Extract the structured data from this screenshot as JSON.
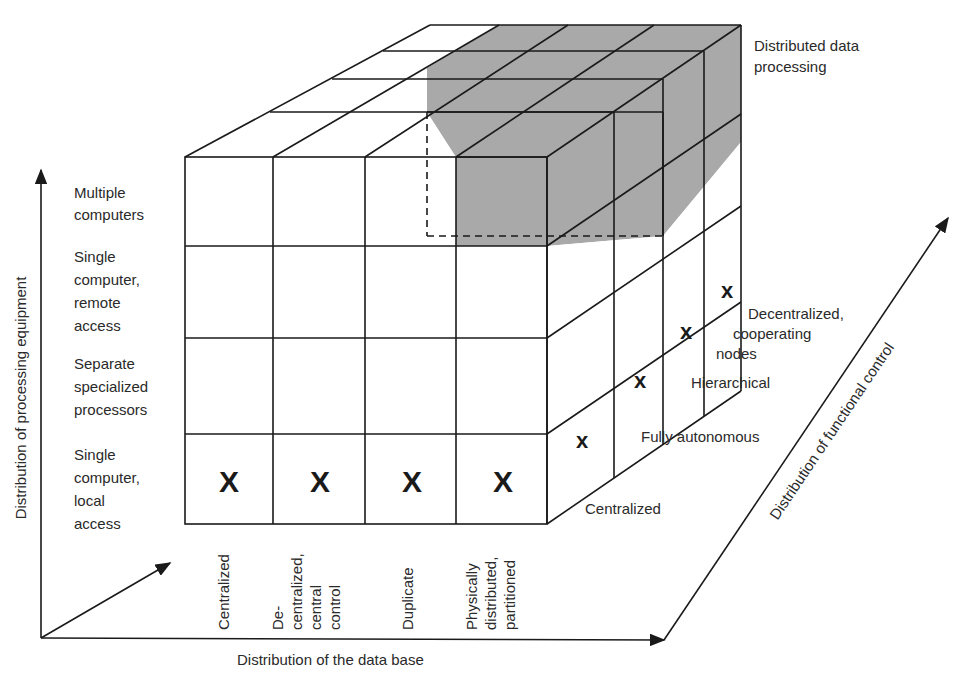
{
  "title": "Distributed data processing",
  "title_lines": [
    "Distributed data",
    "processing"
  ],
  "axes": {
    "vertical": {
      "label": "Distribution of processing equipment"
    },
    "horizontal": {
      "label": "Distribution of the data base"
    },
    "depth": {
      "label": "Distribution of functional control"
    }
  },
  "processing_equipment_levels": [
    {
      "lines": [
        "Single",
        "computer,",
        "local",
        "access"
      ]
    },
    {
      "lines": [
        "Separate",
        "specialized",
        "processors"
      ]
    },
    {
      "lines": [
        "Single",
        "computer,",
        "remote",
        "access"
      ]
    },
    {
      "lines": [
        "Multiple",
        "computers"
      ]
    }
  ],
  "data_base_levels": [
    {
      "lines": [
        "Centralized"
      ]
    },
    {
      "lines": [
        "De-",
        "centralized,",
        "central",
        "control"
      ]
    },
    {
      "lines": [
        "Duplicate"
      ]
    },
    {
      "lines": [
        "Physically",
        "distributed,",
        "partitioned"
      ]
    }
  ],
  "functional_control_levels": [
    {
      "lines": [
        "Centralized"
      ]
    },
    {
      "lines": [
        "Fully autonomous"
      ]
    },
    {
      "lines": [
        "Hierarchical"
      ]
    },
    {
      "lines": [
        "Decentralized,",
        "cooperating",
        "nodes"
      ]
    }
  ],
  "marks": {
    "front_row": [
      "X",
      "X",
      "X",
      "X"
    ],
    "side_column": [
      "x",
      "x",
      "x",
      "x"
    ]
  },
  "colors": {
    "line": "#1a1a1a",
    "shade": "#a8a8a8",
    "background": "#ffffff"
  }
}
